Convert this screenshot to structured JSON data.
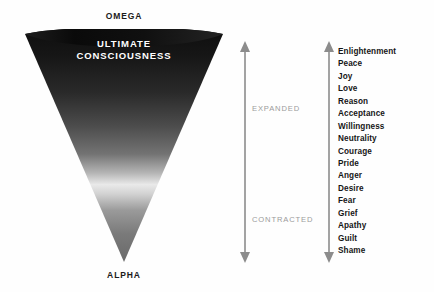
{
  "diagram": {
    "title_top": "OMEGA",
    "title_bottom": "ALPHA",
    "cone_title_line1": "ULTIMATE",
    "cone_title_line2": "CONSCIOUSNESS",
    "band_expanded": "EXPANDED",
    "band_contracted": "CONTRACTED",
    "colors": {
      "background": "#fefefe",
      "cone_top": "#141414",
      "cone_bright_band": "#e8e8e8",
      "cone_tip": "#6e6e6e",
      "text_dark": "#161616",
      "text_muted": "#9b9b9b",
      "arrow": "#8c8c8c",
      "cone_title_text": "#ffffff"
    }
  },
  "levels": [
    {
      "label": "Enlightenment"
    },
    {
      "label": "Peace"
    },
    {
      "label": "Joy"
    },
    {
      "label": "Love"
    },
    {
      "label": "Reason"
    },
    {
      "label": "Acceptance"
    },
    {
      "label": "Willingness"
    },
    {
      "label": "Neutrality"
    },
    {
      "label": "Courage"
    },
    {
      "label": "Pride"
    },
    {
      "label": "Anger"
    },
    {
      "label": "Desire"
    },
    {
      "label": "Fear"
    },
    {
      "label": "Grief"
    },
    {
      "label": "Apathy"
    },
    {
      "label": "Guilt"
    },
    {
      "label": "Shame"
    }
  ],
  "chart_data": {
    "type": "diagram",
    "shape": "inverted-cone",
    "axis_top_label": "OMEGA",
    "axis_bottom_label": "ALPHA",
    "bands": [
      "EXPANDED",
      "CONTRACTED"
    ],
    "scale_top_to_bottom": [
      "Enlightenment",
      "Peace",
      "Joy",
      "Love",
      "Reason",
      "Acceptance",
      "Willingness",
      "Neutrality",
      "Courage",
      "Pride",
      "Anger",
      "Desire",
      "Fear",
      "Grief",
      "Apathy",
      "Guilt",
      "Shame"
    ],
    "gradient_stops": [
      {
        "position": 0.0,
        "color": "#111111"
      },
      {
        "position": 0.3,
        "color": "#2c2c2c"
      },
      {
        "position": 0.52,
        "color": "#6a6a6a"
      },
      {
        "position": 0.66,
        "color": "#e4e4e4"
      },
      {
        "position": 0.8,
        "color": "#8d8d8d"
      },
      {
        "position": 1.0,
        "color": "#6b6b6b"
      }
    ]
  }
}
